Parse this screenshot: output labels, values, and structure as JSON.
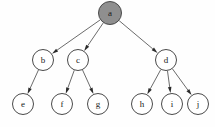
{
  "diagram": {
    "type": "tree",
    "background_color": "#fefefe",
    "node_fill_default": "#ffffff",
    "node_fill_highlight": "#8f8f8f",
    "node_stroke_color": "#4a4a4a",
    "edge_color": "#5a5a5a",
    "arrow_color": "#2b2b2b",
    "label_color": "#1a1a1a",
    "node_radius": 10.5,
    "root_radius": 11.5,
    "nodes": [
      {
        "id": "a",
        "label": "a",
        "cx": 110,
        "cy": 13,
        "r": 11.5,
        "fill": "#8f8f8f",
        "level": 0,
        "highlighted": true
      },
      {
        "id": "b",
        "label": "b",
        "cx": 43,
        "cy": 60,
        "r": 10.5,
        "fill": "#ffffff",
        "level": 1,
        "highlighted": false
      },
      {
        "id": "c",
        "label": "c",
        "cx": 78,
        "cy": 60,
        "r": 10.5,
        "fill": "#ffffff",
        "level": 1,
        "highlighted": false
      },
      {
        "id": "d",
        "label": "d",
        "cx": 166,
        "cy": 60,
        "r": 10.5,
        "fill": "#ffffff",
        "level": 1,
        "highlighted": false
      },
      {
        "id": "e",
        "label": "e",
        "cx": 23,
        "cy": 104,
        "r": 10.5,
        "fill": "#ffffff",
        "level": 2,
        "highlighted": false
      },
      {
        "id": "f",
        "label": "f",
        "cx": 62,
        "cy": 104,
        "r": 10.5,
        "fill": "#ffffff",
        "level": 2,
        "highlighted": false
      },
      {
        "id": "g",
        "label": "g",
        "cx": 98,
        "cy": 104,
        "r": 10.5,
        "fill": "#ffffff",
        "level": 2,
        "highlighted": false
      },
      {
        "id": "h",
        "label": "h",
        "cx": 142,
        "cy": 104,
        "r": 10.5,
        "fill": "#ffffff",
        "level": 2,
        "highlighted": false
      },
      {
        "id": "i",
        "label": "i",
        "cx": 172,
        "cy": 104,
        "r": 10.5,
        "fill": "#ffffff",
        "level": 2,
        "highlighted": false
      },
      {
        "id": "j",
        "label": "j",
        "cx": 198,
        "cy": 104,
        "r": 10.5,
        "fill": "#ffffff",
        "level": 2,
        "highlighted": false
      }
    ],
    "edges": [
      {
        "from": "a",
        "to": "b",
        "directed": true
      },
      {
        "from": "a",
        "to": "c",
        "directed": true
      },
      {
        "from": "a",
        "to": "d",
        "directed": true
      },
      {
        "from": "b",
        "to": "e",
        "directed": true
      },
      {
        "from": "c",
        "to": "f",
        "directed": true
      },
      {
        "from": "c",
        "to": "g",
        "directed": true
      },
      {
        "from": "d",
        "to": "h",
        "directed": true
      },
      {
        "from": "d",
        "to": "i",
        "directed": true
      },
      {
        "from": "d",
        "to": "j",
        "directed": true
      }
    ]
  }
}
